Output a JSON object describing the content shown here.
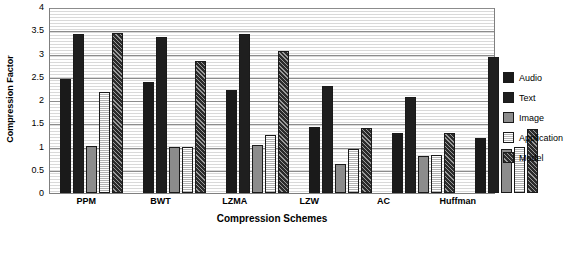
{
  "chart_data": {
    "type": "bar",
    "title": "",
    "xlabel": "Compression Schemes",
    "ylabel": "Compression Factor",
    "ylim": [
      0,
      4
    ],
    "yticks": [
      "0",
      "0.5",
      "1",
      "1.5",
      "2",
      "2.5",
      "3",
      "3.5",
      "4"
    ],
    "grid": true,
    "legend_position": "right",
    "categories": [
      "PPM",
      "BWT",
      "LZMA",
      "LZW",
      "AC",
      "Huffman"
    ],
    "series": [
      {
        "name": "Audio",
        "color": "#1a1a1a",
        "values": [
          2.45,
          2.38,
          2.22,
          1.43,
          1.28,
          1.18
        ]
      },
      {
        "name": "Text",
        "color": "#1f1f1f",
        "values": [
          3.42,
          3.35,
          3.42,
          2.3,
          2.07,
          2.92
        ]
      },
      {
        "name": "Image",
        "color": "#8c8c8c",
        "values": [
          1.02,
          1.0,
          1.03,
          0.62,
          0.8,
          0.95
        ]
      },
      {
        "name": "Application",
        "color": "#e0e0e0",
        "values": [
          2.17,
          1.0,
          1.25,
          0.95,
          0.82,
          1.0
        ]
      },
      {
        "name": "Model",
        "color": "#4d4d4d",
        "values": [
          3.45,
          2.83,
          3.05,
          1.4,
          1.3,
          1.37
        ]
      }
    ]
  }
}
